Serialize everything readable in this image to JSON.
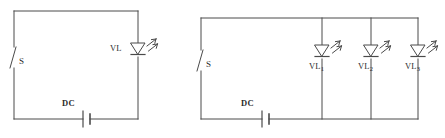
{
  "figure": {
    "kind": "electrical-schematic",
    "stroke_color": "#4a4a4a",
    "text_color": "#2b2b2b",
    "background_color": "#ffffff"
  },
  "circuits": [
    {
      "id": "left",
      "name": "single-led-circuit",
      "switch": {
        "label": "S",
        "state": "open"
      },
      "source": {
        "label": "DC",
        "type": "battery"
      },
      "lamps": [
        {
          "label": "VL",
          "subscript": "",
          "type": "led",
          "label_position": "left"
        }
      ]
    },
    {
      "id": "right",
      "name": "parallel-led-circuit",
      "switch": {
        "label": "S",
        "state": "open"
      },
      "source": {
        "label": "DC",
        "type": "battery"
      },
      "lamps": [
        {
          "label": "VL",
          "subscript": "1",
          "type": "led",
          "label_position": "below"
        },
        {
          "label": "VL",
          "subscript": "2",
          "type": "led",
          "label_position": "below"
        },
        {
          "label": "VL",
          "subscript": "3",
          "type": "led",
          "label_position": "below"
        }
      ]
    }
  ]
}
